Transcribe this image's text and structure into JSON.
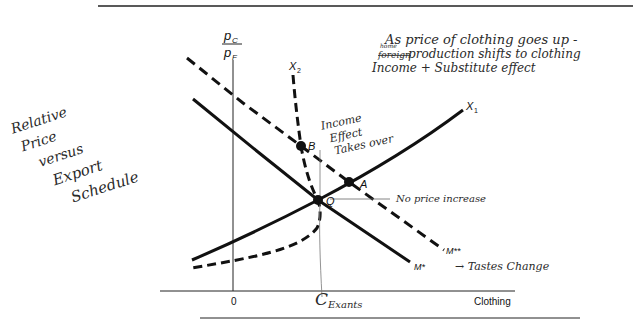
{
  "figure": {
    "y_axis_label_numerator": "p",
    "y_axis_label_numerator_sub": "C",
    "y_axis_label_denominator": "p",
    "y_axis_label_denominator_sub": "F",
    "x_axis_label": "Clothing",
    "origin_label": "0",
    "curves": {
      "x1": {
        "label": "X",
        "sub": "1",
        "style": "solid"
      },
      "x2": {
        "label": "X",
        "sub": "2",
        "style": "dashed"
      },
      "m_star": {
        "label": "M*",
        "style": "solid"
      },
      "m_double_star": {
        "label": "M**",
        "style": "dashed"
      }
    },
    "points": [
      {
        "id": "B",
        "label": "B"
      },
      {
        "id": "A",
        "label": "A"
      },
      {
        "id": "Q",
        "label": "Q"
      }
    ]
  },
  "annotations": {
    "top_note": {
      "line1": "As price of clothing goes up -",
      "line2_strike": "foreign",
      "line2_insert": "home",
      "line2": "production shifts to clothing",
      "line3": "Income + Substitute effect"
    },
    "left_note": [
      "Relative",
      "Price",
      "versus",
      "Export",
      "Schedule"
    ],
    "income_effect": [
      "Income",
      "Effect",
      "Takes over"
    ],
    "no_price_increase": "No price increase",
    "tastes_change": "→ Tastes Change",
    "c_exants": "C",
    "c_exants_sub": "Exants"
  }
}
